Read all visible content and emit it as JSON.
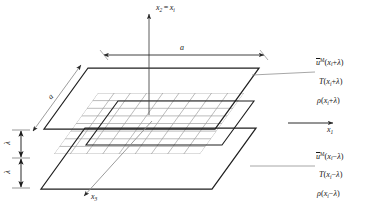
{
  "figure": {
    "background_color": "#ffffff",
    "line_color_dark": "#1a1a1a",
    "line_color_mesh": "#9a9a9a",
    "line_color_leader": "#7a7a7a"
  },
  "axes": {
    "vertical": {
      "label_main": "x",
      "label_main_sub": "2",
      "equals": "=",
      "label_alt": "x",
      "label_alt_sub": "i",
      "direction": "up"
    },
    "horizontal": {
      "label": "x",
      "label_sub": "1",
      "direction": "right"
    },
    "depth": {
      "label": "x",
      "label_sub": "3",
      "direction": "down-left"
    }
  },
  "dimensions": {
    "width": {
      "label": "a",
      "orientation": "horizontal"
    },
    "depth": {
      "label": "a",
      "orientation": "diagonal"
    },
    "gap_upper": {
      "label": "λ",
      "orientation": "vertical"
    },
    "gap_lower": {
      "label": "λ",
      "orientation": "vertical"
    }
  },
  "planes": {
    "upper": {
      "name": "upper-plane",
      "style": "outline",
      "labels": [
        {
          "id": "velocity",
          "base": "u",
          "overbar": true,
          "sup": "M",
          "arg_open": "(",
          "arg_var": "x",
          "arg_sub": "i",
          "arg_sign": "+",
          "arg_lambda": "λ",
          "arg_close": ")"
        },
        {
          "id": "temperature",
          "base": "T",
          "overbar": false,
          "sup": "",
          "arg_open": "(",
          "arg_var": "x",
          "arg_sub": "i",
          "arg_sign": "+",
          "arg_lambda": "λ",
          "arg_close": ")"
        },
        {
          "id": "density",
          "base": "ρ",
          "overbar": false,
          "sup": "",
          "arg_open": "(",
          "arg_var": "x",
          "arg_sub": "i",
          "arg_sign": "+",
          "arg_lambda": "λ",
          "arg_close": ")"
        }
      ]
    },
    "middle": {
      "name": "middle-mesh-plane",
      "style": "mesh",
      "mesh_cols": 9,
      "mesh_rows": 8
    },
    "lower": {
      "name": "lower-plane",
      "style": "outline",
      "labels": [
        {
          "id": "velocity",
          "base": "u",
          "overbar": true,
          "sup": "M",
          "arg_open": "(",
          "arg_var": "x",
          "arg_sub": "i",
          "arg_sign": "−",
          "arg_lambda": "λ",
          "arg_close": ")"
        },
        {
          "id": "temperature",
          "base": "T",
          "overbar": false,
          "sup": "",
          "arg_open": "(",
          "arg_var": "x",
          "arg_sub": "i",
          "arg_sign": "−",
          "arg_lambda": "λ",
          "arg_close": ")"
        },
        {
          "id": "density",
          "base": "ρ",
          "overbar": false,
          "sup": "",
          "arg_open": "(",
          "arg_var": "x",
          "arg_sub": "i",
          "arg_sign": "−",
          "arg_lambda": "λ",
          "arg_close": ")"
        }
      ]
    }
  }
}
